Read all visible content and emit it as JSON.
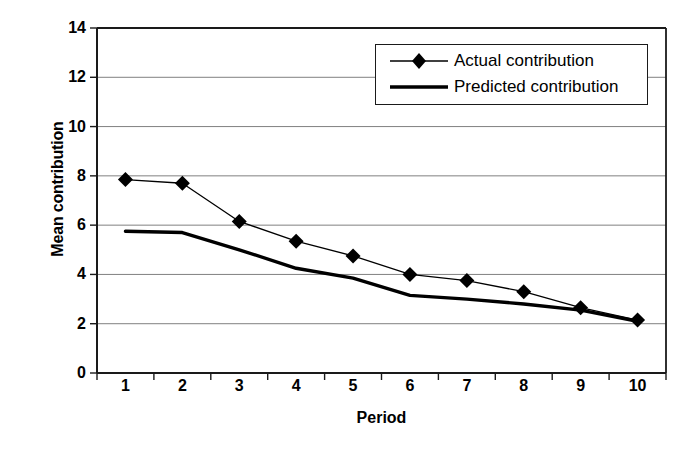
{
  "chart_data": {
    "type": "line",
    "title": "",
    "xlabel": "Period",
    "ylabel": "Mean contribution",
    "x": [
      1,
      2,
      3,
      4,
      5,
      6,
      7,
      8,
      9,
      10
    ],
    "xtick_labels": [
      "1",
      "2",
      "3",
      "4",
      "5",
      "6",
      "7",
      "8",
      "9",
      "10"
    ],
    "ytick_labels": [
      "0",
      "2",
      "4",
      "6",
      "8",
      "10",
      "12",
      "14"
    ],
    "yticks": [
      0,
      2,
      4,
      6,
      8,
      10,
      12,
      14
    ],
    "ylim": [
      0,
      14
    ],
    "grid": "horizontal",
    "legend_position": "top-right",
    "series": [
      {
        "name": "Actual contribution",
        "marker": "diamond",
        "line_width": 1.3,
        "color": "#000000",
        "values": [
          7.85,
          7.7,
          6.15,
          5.35,
          4.75,
          4.0,
          3.75,
          3.3,
          2.65,
          2.15
        ]
      },
      {
        "name": "Predicted contribution",
        "marker": "none",
        "line_width": 3.4,
        "color": "#000000",
        "values": [
          5.75,
          5.7,
          5.0,
          4.25,
          3.85,
          3.15,
          3.0,
          2.8,
          2.55,
          2.1
        ]
      }
    ]
  },
  "legend": {
    "entries": [
      {
        "label": "Actual contribution",
        "key": "line-with-diamond-marker"
      },
      {
        "label": "Predicted contribution",
        "key": "thick-line"
      }
    ]
  },
  "axes": {
    "x_title": "Period",
    "y_title": "Mean contribution"
  }
}
